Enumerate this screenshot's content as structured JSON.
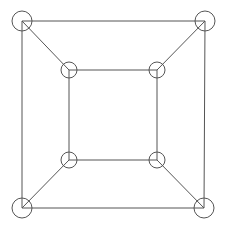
{
  "diagram": {
    "type": "graph",
    "stroke_color": "#555555",
    "node_fill": "none",
    "nodes": [
      {
        "id": "outer-top-left",
        "x": 22,
        "y": 21,
        "r": 10
      },
      {
        "id": "outer-top-right",
        "x": 205,
        "y": 21,
        "r": 10
      },
      {
        "id": "outer-bottom-right",
        "x": 204,
        "y": 208,
        "r": 10
      },
      {
        "id": "outer-bottom-left",
        "x": 22,
        "y": 208,
        "r": 10
      },
      {
        "id": "inner-top-left",
        "x": 69,
        "y": 70,
        "r": 8
      },
      {
        "id": "inner-top-right",
        "x": 157,
        "y": 70,
        "r": 8
      },
      {
        "id": "inner-bottom-right",
        "x": 157,
        "y": 160,
        "r": 8
      },
      {
        "id": "inner-bottom-left",
        "x": 69,
        "y": 160,
        "r": 8
      }
    ],
    "edges": [
      [
        "outer-top-left",
        "outer-top-right"
      ],
      [
        "outer-top-right",
        "outer-bottom-right"
      ],
      [
        "outer-bottom-right",
        "outer-bottom-left"
      ],
      [
        "outer-bottom-left",
        "outer-top-left"
      ],
      [
        "inner-top-left",
        "inner-top-right"
      ],
      [
        "inner-top-right",
        "inner-bottom-right"
      ],
      [
        "inner-bottom-right",
        "inner-bottom-left"
      ],
      [
        "inner-bottom-left",
        "inner-top-left"
      ],
      [
        "outer-top-left",
        "inner-top-left"
      ],
      [
        "outer-top-right",
        "inner-top-right"
      ],
      [
        "outer-bottom-right",
        "inner-bottom-right"
      ],
      [
        "outer-bottom-left",
        "inner-bottom-left"
      ]
    ]
  }
}
